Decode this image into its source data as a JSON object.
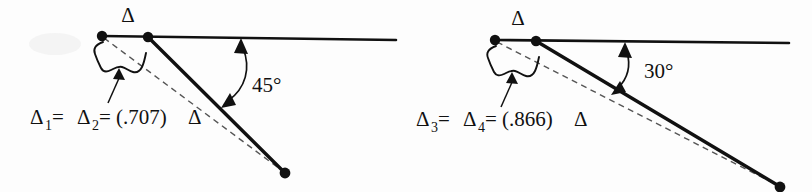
{
  "figure": {
    "background_color": "#fdfdfd",
    "ink_color": "#111111",
    "dashed_color": "#555555",
    "panels": [
      {
        "id": "left",
        "delta_label": "Δ",
        "angle_label": "45°",
        "angle_degrees": 45,
        "formula": {
          "term1": "Δ",
          "sub1": "1",
          "equals1": " = ",
          "term2": "Δ",
          "sub2": "2",
          "equals2": " = (.707)",
          "term3": "Δ",
          "coefficient": ".707",
          "full_text": "Δ1 = Δ2 = (.707)Δ"
        }
      },
      {
        "id": "right",
        "delta_label": "Δ",
        "angle_label": "30°",
        "angle_degrees": 30,
        "formula": {
          "term1": "Δ",
          "sub1": "3",
          "equals1": " = ",
          "term2": "Δ",
          "sub2": "4",
          "equals2": " = (.866)",
          "term3": "Δ",
          "coefficient": ".866",
          "full_text": "Δ3 = Δ4 = (.866)Δ"
        }
      }
    ]
  }
}
